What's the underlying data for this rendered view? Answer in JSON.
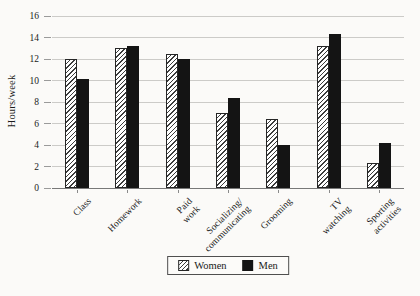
{
  "chart_data": {
    "type": "bar",
    "title": "",
    "xlabel": "",
    "ylabel": "Hours/week",
    "categories": [
      "Class",
      "Homework",
      "Paid work",
      "Socializing/\ncommunicating",
      "Grooming",
      "TV watching",
      "Sporting\nactivities"
    ],
    "series": [
      {
        "name": "Women",
        "values": [
          12.0,
          13.0,
          12.5,
          7.0,
          6.4,
          13.2,
          2.3
        ]
      },
      {
        "name": "Men",
        "values": [
          10.1,
          13.2,
          12.0,
          8.4,
          4.0,
          14.3,
          4.2
        ]
      }
    ],
    "ylim": [
      0,
      16
    ],
    "yticks": [
      0,
      2,
      4,
      6,
      8,
      10,
      12,
      14,
      16
    ],
    "grid": true,
    "legend_position": "bottom-center",
    "colors": {
      "women_fill": "white-with-diagonal-hatch",
      "hatch_line": "#3c3c3c",
      "men_fill": "#141414",
      "gridline": "#cccbc8",
      "axis_line": "#787878",
      "text": "#1a1a1a",
      "background": "#fbfaf8"
    }
  }
}
